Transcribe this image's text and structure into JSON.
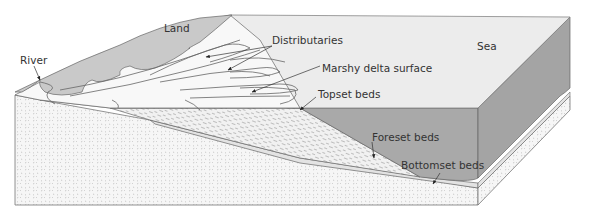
{
  "labels": {
    "land": "Land",
    "river": "River",
    "distributaries": "Distributaries",
    "marshy": "Marshy delta surface",
    "topset": "Topset beds",
    "sea": "Sea",
    "foreset": "Foreset beds",
    "bottomset": "Bottomset beds"
  },
  "colors": {
    "land": "#c9c9c9",
    "sea_surface": "#ececec",
    "sea_water": "#a9a9a9",
    "delta_surface": "#f7f7f7",
    "bedrock": "#f4f4f4",
    "bottomset": "#e2e2e2",
    "outline": "#555555"
  }
}
